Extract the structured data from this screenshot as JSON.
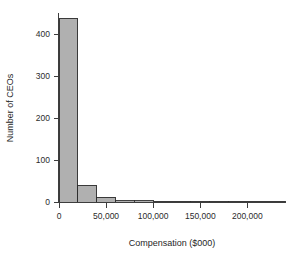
{
  "chart_data": {
    "type": "bar",
    "title": "",
    "subtitle": "",
    "xlabel": "Compensation ($000)",
    "ylabel": "Number of CEOs",
    "grid": false,
    "legend": null,
    "bin_width": 20000,
    "xlim": [
      0,
      240000
    ],
    "ylim": [
      0,
      450
    ],
    "xticks": [
      0,
      50000,
      100000,
      150000,
      200000
    ],
    "xticklabels": [
      "0",
      "50,000",
      "100,000",
      "150,000",
      "200,000"
    ],
    "yticks": [
      0,
      100,
      200,
      300,
      400
    ],
    "yticklabels": [
      "0",
      "100",
      "200",
      "300",
      "400"
    ],
    "bin_edges": [
      0,
      20000,
      40000,
      60000,
      80000,
      100000,
      120000,
      140000,
      160000,
      180000,
      200000,
      220000,
      240000
    ],
    "categories": [
      "0-20,000",
      "20,000-40,000",
      "40,000-60,000",
      "60,000-80,000",
      "80,000-100,000",
      "100,000-120,000",
      "120,000-140,000",
      "140,000-160,000",
      "160,000-180,000",
      "180,000-200,000",
      "200,000-220,000",
      "220,000-240,000"
    ],
    "values": [
      437,
      40,
      11,
      3,
      3,
      0,
      2,
      2,
      0,
      0,
      0,
      2
    ],
    "bar_fill_color": "#b0b0b0",
    "bar_border_color": "#2e2e2e",
    "axis_color": "#3d3d3d",
    "background_color": "#ffffff"
  },
  "axes": {
    "x_title": "Compensation ($000)",
    "y_title": "Number of CEOs"
  },
  "xtick_labels": {
    "t0": "0",
    "t1": "50,000",
    "t2": "100,000",
    "t3": "150,000",
    "t4": "200,000"
  },
  "ytick_labels": {
    "t0": "0",
    "t1": "100",
    "t2": "200",
    "t3": "300",
    "t4": "400"
  }
}
